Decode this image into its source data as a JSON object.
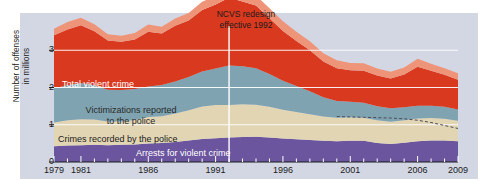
{
  "chart_data": {
    "type": "area",
    "title": "",
    "xlabel": "",
    "ylabel": "Number of offenses in millions",
    "ylabel_line1": "Number of offenses",
    "ylabel_line2": "in millions",
    "ylim": [
      0,
      4
    ],
    "xlim": [
      1979,
      2009
    ],
    "yticks": [
      "0",
      "1",
      "2",
      "3"
    ],
    "ytick_values": [
      0,
      1,
      2,
      3
    ],
    "xticks": [
      "1979",
      "1981",
      "1986",
      "1991",
      "1996",
      "2001",
      "2006",
      "2009"
    ],
    "xtick_values": [
      1979,
      1981,
      1986,
      1991,
      1996,
      2001,
      2006,
      2009
    ],
    "grid": true,
    "legend_position": "inline-labels",
    "stacked": true,
    "annotations": [
      {
        "text_line1": "NCVS redesign",
        "text_line2": "effective 1992",
        "x": 1992
      }
    ],
    "x": [
      1979,
      1980,
      1981,
      1982,
      1983,
      1984,
      1985,
      1986,
      1987,
      1988,
      1989,
      1990,
      1991,
      1992,
      1993,
      1994,
      1995,
      1996,
      1997,
      1998,
      1999,
      2000,
      2001,
      2002,
      2003,
      2004,
      2005,
      2006,
      2007,
      2008,
      2009
    ],
    "series": [
      {
        "name": "Arrests for violent crime",
        "color": "#6b559e",
        "values": [
          0.42,
          0.44,
          0.45,
          0.46,
          0.45,
          0.46,
          0.47,
          0.5,
          0.51,
          0.54,
          0.58,
          0.62,
          0.64,
          0.66,
          0.67,
          0.68,
          0.66,
          0.63,
          0.61,
          0.59,
          0.57,
          0.56,
          0.57,
          0.57,
          0.51,
          0.48,
          0.52,
          0.56,
          0.58,
          0.58,
          0.56
        ]
      },
      {
        "name": "Crimes recorded by the police",
        "color": "#e2d5b4",
        "values": [
          0.64,
          0.68,
          0.7,
          0.68,
          0.64,
          0.63,
          0.66,
          0.71,
          0.72,
          0.76,
          0.81,
          0.87,
          0.89,
          0.87,
          0.88,
          0.86,
          0.82,
          0.77,
          0.73,
          0.69,
          0.65,
          0.63,
          0.63,
          0.62,
          0.61,
          0.6,
          0.6,
          0.61,
          0.6,
          0.58,
          0.55
        ]
      },
      {
        "name": "Victimizations reported to the police",
        "color": "#7fa3b0",
        "values": [
          0.92,
          0.94,
          0.97,
          0.92,
          0.85,
          0.84,
          0.83,
          0.82,
          0.84,
          0.86,
          0.89,
          0.94,
          0.98,
          1.06,
          1.02,
          0.98,
          0.88,
          0.78,
          0.7,
          0.62,
          0.52,
          0.45,
          0.42,
          0.4,
          0.38,
          0.36,
          0.35,
          0.34,
          0.33,
          0.32,
          0.3
        ]
      },
      {
        "name": "Total violent crime",
        "color": "#d9391f",
        "values": [
          1.42,
          1.5,
          1.55,
          1.45,
          1.32,
          1.3,
          1.33,
          1.47,
          1.38,
          1.5,
          1.52,
          1.65,
          1.72,
          1.82,
          1.74,
          1.68,
          1.5,
          1.34,
          1.21,
          1.1,
          0.96,
          0.88,
          0.84,
          0.86,
          0.82,
          0.8,
          0.88,
          1.05,
          0.94,
          0.86,
          0.8
        ]
      },
      {
        "name": "Total violent crime (upper estimate band)",
        "color": "#ee9478",
        "values": [
          0.18,
          0.2,
          0.2,
          0.19,
          0.17,
          0.16,
          0.17,
          0.19,
          0.18,
          0.19,
          0.2,
          0.22,
          0.24,
          0.26,
          0.26,
          0.27,
          0.27,
          0.26,
          0.25,
          0.24,
          0.22,
          0.21,
          0.2,
          0.2,
          0.19,
          0.18,
          0.19,
          0.21,
          0.19,
          0.18,
          0.17
        ]
      }
    ],
    "dashed_line": {
      "name": "reference-trend",
      "color": "#4b4b5a",
      "x": [
        2000,
        2001,
        2002,
        2003,
        2004,
        2005,
        2006,
        2007,
        2008,
        2009
      ],
      "values": [
        1.22,
        1.21,
        1.2,
        1.19,
        1.18,
        1.16,
        1.12,
        1.06,
        0.98,
        0.9
      ]
    },
    "colors": {
      "plot_background": "#d3d7e4",
      "page_background": "#ffffff",
      "total_violent_crime": "#d9391f",
      "upper_band": "#ee9478",
      "victimizations_reported": "#7fa3b0",
      "crimes_recorded": "#e2d5b4",
      "arrests": "#6b559e",
      "gridline": "#ffffff",
      "redesign_line": "#ffffff",
      "dashed_line": "#4b4b5a",
      "text": "#1b1b1b"
    }
  },
  "labels": {
    "total_violent_crime": "Total violent crime",
    "victimizations_l1": "Victimizations reported",
    "victimizations_l2": "to the police",
    "crimes_recorded": "Crimes recorded by the police",
    "arrests": "Arrests for violent crime"
  }
}
